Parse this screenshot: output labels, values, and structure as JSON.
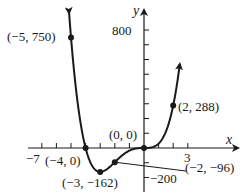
{
  "chart_data": {
    "type": "line",
    "title": "",
    "function": "y = 6x^3(x + 4)",
    "xlabel": "x",
    "ylabel": "y",
    "xlim": [
      -7,
      3
    ],
    "ylim": [
      -200,
      800
    ],
    "x_tick_step": 1,
    "y_tick_step": 100,
    "x_tick_labels": [
      "-7",
      "3"
    ],
    "y_tick_labels": [
      "800",
      "-200"
    ],
    "grid": false,
    "legend": null,
    "labeled_points": [
      {
        "x": -5,
        "y": 750,
        "label": "(−5, 750)"
      },
      {
        "x": -4,
        "y": 0,
        "label": "(−4, 0)"
      },
      {
        "x": -3,
        "y": -162,
        "label": "(−3, −162)"
      },
      {
        "x": -2,
        "y": -96,
        "label": "(−2, −96)"
      },
      {
        "x": 0,
        "y": 0,
        "label": "(0, 0)"
      },
      {
        "x": 2,
        "y": 288,
        "label": "(2, 288)"
      }
    ],
    "series": [
      {
        "name": "f(x)",
        "x": [
          -5.1,
          -5,
          -4.5,
          -4,
          -3.5,
          -3,
          -2.5,
          -2,
          -1.5,
          -1,
          -0.5,
          0,
          0.5,
          1,
          1.5,
          2,
          2.5
        ],
        "values": [
          832.2,
          750,
          297.6,
          0,
          -128.6,
          -162,
          -140.6,
          -96,
          -50.6,
          -18,
          -2.6,
          0,
          3.4,
          30,
          111.4,
          288,
          609.4
        ]
      }
    ]
  },
  "labels": {
    "y_axis": "y",
    "x_axis": "x",
    "tick_800": "800",
    "tick_neg200": "−200",
    "tick_neg7": "−7",
    "tick_3": "3",
    "pt_m5": "(−5, 750)",
    "pt_m4": "(−4, 0)",
    "pt_m3": "(−3, −162)",
    "pt_m2": "(−2, −96)",
    "pt_0": "(0, 0)",
    "pt_2": "(2, 288)"
  }
}
